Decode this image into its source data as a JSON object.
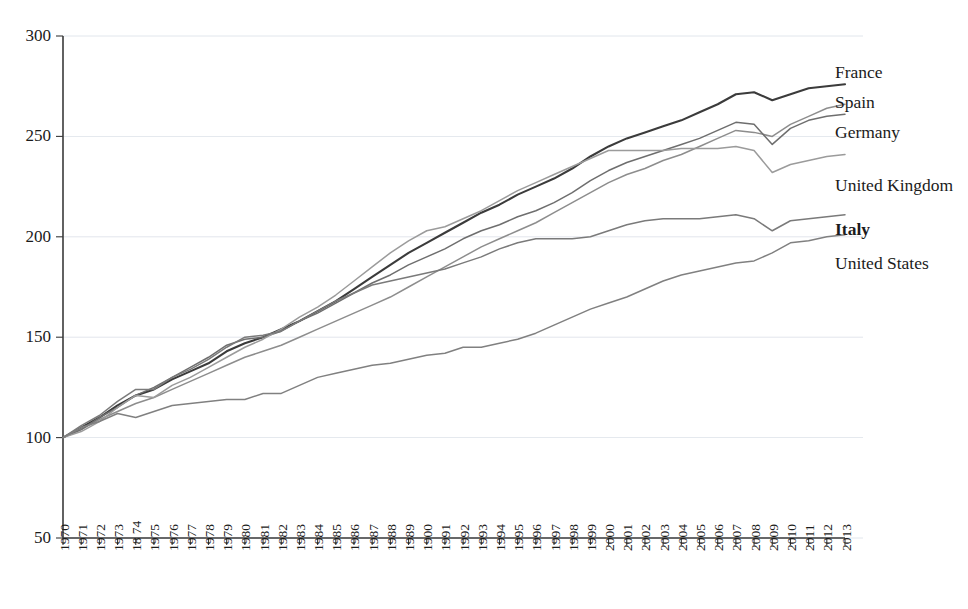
{
  "chart_data": {
    "type": "line",
    "title": "",
    "subtitle": "",
    "xlabel": "",
    "ylabel": "",
    "xlim": [
      1970,
      2013
    ],
    "ylim": [
      50,
      300
    ],
    "grid": true,
    "legend_position": "right-inline-labels",
    "y_ticks": [
      50,
      100,
      150,
      200,
      250,
      300
    ],
    "x": [
      1970,
      1971,
      1972,
      1973,
      1974,
      1975,
      1976,
      1977,
      1978,
      1979,
      1980,
      1981,
      1982,
      1983,
      1984,
      1985,
      1986,
      1987,
      1988,
      1989,
      1990,
      1991,
      1992,
      1993,
      1994,
      1995,
      1996,
      1997,
      1998,
      1999,
      2000,
      2001,
      2002,
      2003,
      2004,
      2005,
      2006,
      2007,
      2008,
      2009,
      2010,
      2011,
      2012,
      2013
    ],
    "x_tick_labels": [
      "1970",
      "1971",
      "1972",
      "1973",
      "18 74",
      "1975",
      "1976",
      "1977",
      "1978",
      "1979",
      "1980",
      "1981",
      "1982",
      "1983",
      "1984",
      "1985",
      "1986",
      "1987",
      "1988",
      "1989",
      "1900",
      "1991",
      "1992",
      "1993",
      "1994",
      "1995",
      "1996",
      "1997",
      "1998",
      "1999",
      "2000",
      "2001",
      "2002",
      "2003",
      "2004",
      "2005",
      "2006",
      "2007",
      "2008",
      "2009",
      "2010",
      "2011",
      "2012",
      "2013"
    ],
    "series": [
      {
        "name": "France",
        "color": "#3b3b3b",
        "width": 2.1,
        "label_x": 2013,
        "label_y": 281,
        "bold": false,
        "values": [
          100,
          105,
          110,
          116,
          121,
          124,
          129,
          133,
          137,
          143,
          147,
          150,
          154,
          158,
          163,
          168,
          174,
          180,
          186,
          192,
          197,
          202,
          207,
          212,
          216,
          221,
          225,
          229,
          234,
          240,
          245,
          249,
          252,
          255,
          258,
          262,
          266,
          271,
          272,
          268,
          271,
          274,
          275,
          276
        ]
      },
      {
        "name": "Spain",
        "color": "#8d8d8d",
        "width": 1.5,
        "label_x": 2013,
        "label_y": 266,
        "bold": false,
        "values": [
          100,
          104,
          109,
          113,
          117,
          120,
          124,
          128,
          132,
          136,
          140,
          143,
          146,
          150,
          154,
          158,
          162,
          166,
          170,
          175,
          180,
          185,
          190,
          195,
          199,
          203,
          207,
          212,
          217,
          222,
          227,
          231,
          234,
          238,
          241,
          245,
          249,
          253,
          252,
          250,
          256,
          260,
          264,
          266
        ]
      },
      {
        "name": "Germany",
        "color": "#6e6e6e",
        "width": 1.5,
        "label_x": 2013,
        "label_y": 251,
        "bold": false,
        "values": [
          100,
          104,
          110,
          115,
          121,
          125,
          130,
          135,
          140,
          146,
          149,
          150,
          153,
          158,
          162,
          167,
          172,
          177,
          181,
          186,
          190,
          194,
          199,
          203,
          206,
          210,
          213,
          217,
          222,
          228,
          233,
          237,
          240,
          243,
          246,
          249,
          253,
          257,
          256,
          246,
          254,
          258,
          260,
          261
        ]
      },
      {
        "name": "United Kingdom",
        "color": "#9b9b9b",
        "width": 1.5,
        "label_x": 2013,
        "label_y": 225,
        "bold": false,
        "values": [
          100,
          103,
          108,
          115,
          121,
          120,
          126,
          130,
          135,
          140,
          145,
          149,
          154,
          160,
          165,
          171,
          178,
          185,
          192,
          198,
          203,
          205,
          209,
          213,
          218,
          223,
          227,
          231,
          235,
          239,
          243,
          243,
          243,
          243,
          244,
          244,
          244,
          245,
          243,
          232,
          236,
          238,
          240,
          241
        ]
      },
      {
        "name": "Italy",
        "color": "#7a7a7a",
        "width": 1.5,
        "label_x": 2013,
        "label_y": 203,
        "bold": true,
        "values": [
          100,
          106,
          111,
          118,
          124,
          124,
          130,
          134,
          139,
          145,
          150,
          151,
          153,
          158,
          163,
          168,
          172,
          176,
          178,
          180,
          182,
          184,
          187,
          190,
          194,
          197,
          199,
          199,
          199,
          200,
          203,
          206,
          208,
          209,
          209,
          209,
          210,
          211,
          209,
          203,
          208,
          209,
          210,
          211
        ]
      },
      {
        "name": "United States",
        "color": "#808080",
        "width": 1.5,
        "label_x": 2013,
        "label_y": 186,
        "bold": false,
        "values": [
          100,
          105,
          108,
          112,
          110,
          113,
          116,
          117,
          118,
          119,
          119,
          122,
          122,
          126,
          130,
          132,
          134,
          136,
          137,
          139,
          141,
          142,
          145,
          145,
          147,
          149,
          152,
          156,
          160,
          164,
          167,
          170,
          174,
          178,
          181,
          183,
          185,
          187,
          188,
          192,
          197,
          198,
          200,
          201
        ]
      }
    ]
  },
  "axes": {
    "y_axis_name": "index-axis",
    "x_axis_name": "year-axis"
  }
}
